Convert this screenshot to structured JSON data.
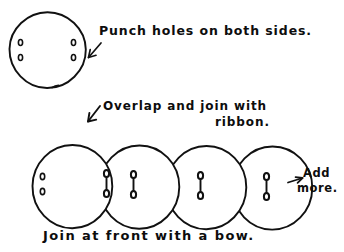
{
  "page": {
    "title": "Punch holes on both sides",
    "background_color": "#ffffff",
    "ink_color": "#111111",
    "medium": "hand-drawn pen sketch"
  },
  "labels": {
    "punch_holes": "Punch holes on both sides.",
    "overlap_line1": "Overlap and join with",
    "overlap_line2": "ribbon.",
    "add_more_line1": "Add",
    "add_more_line2": "more.",
    "join_front": "Join at front with a bow."
  },
  "icons": {
    "arrow_to_top_circle": "arrow-down-left-icon",
    "arrow_to_circle_row": "arrow-down-left-icon",
    "arrow_to_add_more": "arrow-right-icon"
  },
  "figures": {
    "top_circle": {
      "name": "punched-circle-top",
      "cx": 47,
      "cy": 50,
      "rx": 38,
      "ry": 38,
      "holes_left": 2,
      "holes_right": 2,
      "hole_count_total": 4
    },
    "circle_row": {
      "name": "overlapping-circle-row",
      "count": 4,
      "cy": 188,
      "rx": 40,
      "ry": 42,
      "centers_x": [
        72,
        139,
        206,
        272
      ],
      "open_holes_on_first": 2,
      "ribbon_ties": 4
    }
  },
  "annotations": [
    {
      "id": "punch-holes",
      "text": "Punch holes on both sides.",
      "arrow": "arrow-down-left-icon",
      "points_to": "punched-circle-top"
    },
    {
      "id": "overlap-join",
      "text": "Overlap and join with ribbon.",
      "arrow": "arrow-down-left-icon",
      "points_to": "overlapping-circle-row"
    },
    {
      "id": "add-more",
      "text": "Add more.",
      "arrow": "arrow-right-icon",
      "points_to": "overlapping-circle-row"
    },
    {
      "id": "join-front",
      "text": "Join at front with a bow.",
      "arrow": "none",
      "points_to": "overlapping-circle-row"
    }
  ]
}
